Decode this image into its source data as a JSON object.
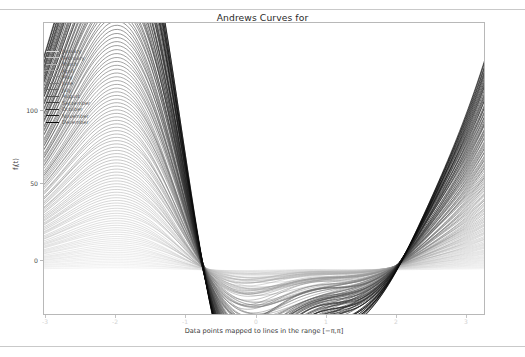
{
  "figure": {
    "title_lines": [
      "Andrews Curves for",
      "Mean Monthly Temperatures, 1894-2013",
      "Saint Francis, KS, USA"
    ],
    "background_color": "#ffffff",
    "frame_color": "#b8b8b8"
  },
  "chart_data": {
    "type": "line",
    "title": "Andrews Curves for Mean Monthly Temperatures, 1894-2013 Saint Francis, KS, USA",
    "xlabel": "Data points mapped to lines in the range $[-\\pi,\\pi]$",
    "ylabel": "f_i(t)",
    "xlim": [
      -3.141592653589793,
      3.141592653589793
    ],
    "ylim": [
      -35,
      190
    ],
    "grid": false,
    "legend_position": "upper left",
    "xticks": [
      -3,
      -2,
      -1,
      0,
      1,
      2,
      3
    ],
    "xticklabels": [
      "-3",
      "-2",
      "-1",
      "0",
      "1",
      "2",
      "3"
    ],
    "yticks": [
      0,
      50,
      100
    ],
    "yticklabels": [
      "0",
      "50",
      "100"
    ],
    "series_label_field": "month",
    "categories": [
      "January",
      "February",
      "March",
      "April",
      "May",
      "June",
      "July",
      "August",
      "September",
      "October",
      "November",
      "December"
    ],
    "series": [
      {
        "name": "January",
        "color": "#d9d9d9",
        "mean_temp": 26.5,
        "amplitude": 62,
        "curve_peak_t": 1.55,
        "curve_peak_y": 58,
        "curve_start_y": 22,
        "curve_min_y": -12
      },
      {
        "name": "February",
        "color": "#c6c6c6",
        "mean_temp": 31.2,
        "amplitude": 70,
        "curve_peak_t": 1.55,
        "curve_peak_y": 68,
        "curve_start_y": 26,
        "curve_min_y": -14
      },
      {
        "name": "March",
        "color": "#b3b3b3",
        "mean_temp": 40.1,
        "amplitude": 82,
        "curve_peak_t": 1.55,
        "curve_peak_y": 82,
        "curve_start_y": 31,
        "curve_min_y": -16
      },
      {
        "name": "April",
        "color": "#a0a0a0",
        "mean_temp": 49.8,
        "amplitude": 95,
        "curve_peak_t": 1.55,
        "curve_peak_y": 96,
        "curve_start_y": 37,
        "curve_min_y": -18
      },
      {
        "name": "May",
        "color": "#8d8d8d",
        "mean_temp": 59.4,
        "amplitude": 108,
        "curve_peak_t": 1.55,
        "curve_peak_y": 110,
        "curve_start_y": 42,
        "curve_min_y": -20
      },
      {
        "name": "June",
        "color": "#7a7a7a",
        "mean_temp": 69.7,
        "amplitude": 122,
        "curve_peak_t": 1.55,
        "curve_peak_y": 124,
        "curve_start_y": 48,
        "curve_min_y": -22
      },
      {
        "name": "July",
        "color": "#676767",
        "mean_temp": 76.3,
        "amplitude": 134,
        "curve_peak_t": 1.55,
        "curve_peak_y": 137,
        "curve_start_y": 53,
        "curve_min_y": -24
      },
      {
        "name": "August",
        "color": "#545454",
        "mean_temp": 74.5,
        "amplitude": 145,
        "curve_peak_t": 1.55,
        "curve_peak_y": 149,
        "curve_start_y": 57,
        "curve_min_y": -25
      },
      {
        "name": "September",
        "color": "#414141",
        "mean_temp": 65.1,
        "amplitude": 155,
        "curve_peak_t": 1.55,
        "curve_peak_y": 159,
        "curve_start_y": 61,
        "curve_min_y": -27
      },
      {
        "name": "October",
        "color": "#2e2e2e",
        "mean_temp": 53.0,
        "amplitude": 164,
        "curve_peak_t": 1.55,
        "curve_peak_y": 168,
        "curve_start_y": 64,
        "curve_min_y": -28
      },
      {
        "name": "November",
        "color": "#1b1b1b",
        "mean_temp": 38.7,
        "amplitude": 172,
        "curve_peak_t": 1.55,
        "curve_peak_y": 176,
        "curve_start_y": 67,
        "curve_min_y": -29
      },
      {
        "name": "December",
        "color": "#080808",
        "mean_temp": 28.9,
        "amplitude": 178,
        "curve_peak_t": 1.55,
        "curve_peak_y": 182,
        "curve_start_y": 70,
        "curve_min_y": -30
      }
    ],
    "n_curves": 120
  },
  "legend": {
    "items": [
      {
        "label": "January",
        "color": "#d9d9d9",
        "width": 0.7
      },
      {
        "label": "February",
        "color": "#c6c6c6",
        "width": 0.7
      },
      {
        "label": "March",
        "color": "#b3b3b3",
        "width": 0.8
      },
      {
        "label": "April",
        "color": "#a0a0a0",
        "width": 0.8
      },
      {
        "label": "May",
        "color": "#8d8d8d",
        "width": 0.9
      },
      {
        "label": "June",
        "color": "#7a7a7a",
        "width": 0.9
      },
      {
        "label": "July",
        "color": "#676767",
        "width": 1.0
      },
      {
        "label": "August",
        "color": "#545454",
        "width": 1.1
      },
      {
        "label": "September",
        "color": "#414141",
        "width": 1.1
      },
      {
        "label": "October",
        "color": "#2e2e2e",
        "width": 1.2
      },
      {
        "label": "November",
        "color": "#1b1b1b",
        "width": 1.2
      },
      {
        "label": "December",
        "color": "#080808",
        "width": 1.3
      }
    ]
  },
  "yaxis": {
    "label_main": "f",
    "label_sub": "i",
    "label_tail": "(t)",
    "ticks": [
      {
        "text": "100",
        "top": 110
      },
      {
        "text": "50",
        "top": 183
      },
      {
        "text": "0",
        "top": 260
      }
    ]
  },
  "xaxis": {
    "label": "Data points mapped to lines in the range [−π,π]",
    "ticks": [
      {
        "text": "-3",
        "left": 45
      },
      {
        "text": "-2",
        "left": 115
      },
      {
        "text": "-1",
        "left": 185
      },
      {
        "text": "0",
        "left": 256
      },
      {
        "text": "1",
        "left": 326
      },
      {
        "text": "2",
        "left": 396
      },
      {
        "text": "3",
        "left": 466
      }
    ]
  }
}
